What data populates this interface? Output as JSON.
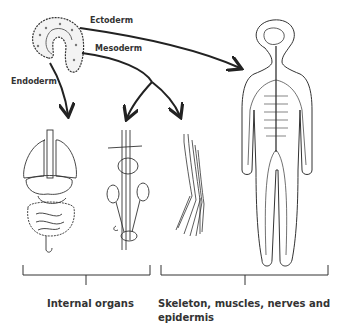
{
  "diagram": {
    "germ_layers": {
      "ectoderm": "Ectoderm",
      "mesoderm": "Mesoderm",
      "endoderm": "Endoderm"
    },
    "groups": {
      "internal": "Internal organs",
      "external_line1": "Skeleton, muscles, nerves and",
      "external_line2": "epidermis"
    },
    "colors": {
      "ink": "#222222",
      "text": "#333333",
      "background": "#ffffff"
    }
  }
}
